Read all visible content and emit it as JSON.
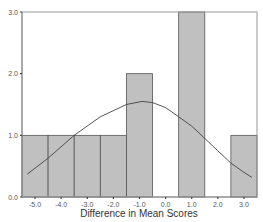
{
  "chart_data": {
    "type": "bar",
    "subtype": "histogram_with_normal_curve",
    "title": "",
    "xlabel": "Difference in Mean Scores",
    "ylabel": "",
    "categories": [
      "-5.0",
      "-4.0",
      "-3.0",
      "-2.0",
      "-1.0",
      "0.0",
      "1.0",
      "2.0",
      "3.0"
    ],
    "values": [
      1,
      1,
      1,
      1,
      2,
      0,
      3,
      0,
      1
    ],
    "yticks": [
      "0.0",
      "1.0",
      "2.0",
      "3.0"
    ],
    "ylim": [
      0,
      3
    ],
    "xlim": [
      -5.5,
      3.5
    ],
    "grid": false,
    "legend": null,
    "normal_curve": {
      "approx_points": [
        [
          -5.3,
          0.37
        ],
        [
          -4.5,
          0.63
        ],
        [
          -3.5,
          1.0
        ],
        [
          -2.5,
          1.3
        ],
        [
          -1.5,
          1.5
        ],
        [
          -0.9,
          1.55
        ],
        [
          -0.5,
          1.53
        ],
        [
          0.0,
          1.45
        ],
        [
          0.5,
          1.3
        ],
        [
          1.0,
          1.15
        ],
        [
          1.5,
          0.95
        ],
        [
          2.0,
          0.75
        ],
        [
          2.5,
          0.55
        ],
        [
          3.0,
          0.4
        ],
        [
          3.3,
          0.32
        ]
      ]
    },
    "colors": {
      "bar_fill": "#c0c0c0",
      "bar_edge": "#555555",
      "curve": "#444444",
      "frame": "#888888"
    }
  }
}
